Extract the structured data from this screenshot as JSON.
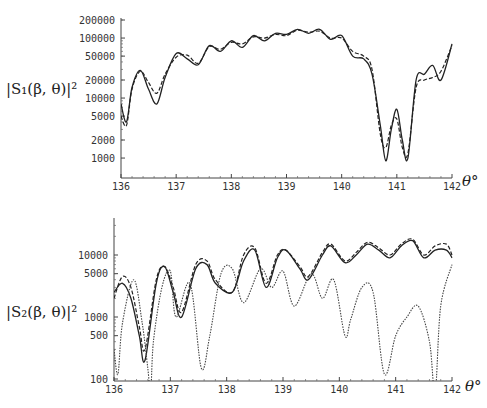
{
  "chart_data": [
    {
      "type": "line",
      "title": "",
      "ylabel": "|S1(β,θ)|²",
      "xlabel": "θ°",
      "yscale": "log",
      "ylim": [
        1000,
        200000
      ],
      "xlim": [
        136,
        142
      ],
      "xticks": [
        "136",
        "137",
        "138",
        "139",
        "140",
        "141",
        "142"
      ],
      "yticks": [
        "200000",
        "100000",
        "50000",
        "20000",
        "10000",
        "5000",
        "2000",
        "1000"
      ],
      "grid": false,
      "legend": null,
      "series": [
        {
          "name": "solid",
          "style": "solid",
          "x": [
            136.0,
            136.1,
            136.2,
            136.35,
            136.5,
            136.65,
            136.8,
            137.0,
            137.2,
            137.4,
            137.6,
            137.8,
            138.0,
            138.2,
            138.4,
            138.6,
            138.8,
            139.0,
            139.2,
            139.4,
            139.6,
            139.8,
            140.0,
            140.2,
            140.4,
            140.55,
            140.7,
            140.8,
            140.9,
            141.0,
            141.1,
            141.2,
            141.35,
            141.5,
            141.65,
            141.8,
            142.0
          ],
          "y": [
            8000,
            4000,
            15000,
            29000,
            14000,
            8000,
            22000,
            55000,
            45000,
            36000,
            75000,
            60000,
            90000,
            70000,
            110000,
            90000,
            120000,
            115000,
            140000,
            120000,
            140000,
            95000,
            110000,
            50000,
            45000,
            25000,
            3500,
            900,
            3000,
            6500,
            2000,
            1000,
            20000,
            25000,
            35000,
            20000,
            80000
          ]
        },
        {
          "name": "dashed",
          "style": "dashed",
          "x": [
            136.0,
            136.1,
            136.2,
            136.35,
            136.5,
            136.65,
            136.8,
            137.0,
            137.2,
            137.4,
            137.6,
            137.8,
            138.0,
            138.2,
            138.4,
            138.6,
            138.8,
            139.0,
            139.2,
            139.4,
            139.6,
            139.8,
            140.0,
            140.2,
            140.4,
            140.55,
            140.7,
            140.8,
            140.9,
            141.0,
            141.1,
            141.2,
            141.35,
            141.5,
            141.65,
            141.8,
            142.0
          ],
          "y": [
            5000,
            3500,
            14000,
            28000,
            18000,
            12000,
            25000,
            48000,
            52000,
            38000,
            72000,
            65000,
            85000,
            80000,
            105000,
            100000,
            115000,
            110000,
            135000,
            125000,
            130000,
            100000,
            100000,
            60000,
            50000,
            30000,
            2500,
            1500,
            3500,
            4500,
            1500,
            1200,
            15000,
            20000,
            22000,
            28000,
            75000
          ]
        }
      ]
    },
    {
      "type": "line",
      "title": "",
      "ylabel": "|S2(β,θ)|²",
      "xlabel": "θ°",
      "yscale": "log",
      "ylim": [
        100,
        40000
      ],
      "xlim": [
        136,
        142
      ],
      "xticks": [
        "136",
        "137",
        "138",
        "139",
        "140",
        "141",
        "142"
      ],
      "yticks": [
        "10000",
        "5000",
        "1000",
        "500",
        "100"
      ],
      "grid": false,
      "legend": null,
      "series": [
        {
          "name": "solid",
          "style": "solid",
          "x": [
            136.0,
            136.15,
            136.3,
            136.45,
            136.55,
            136.75,
            136.9,
            137.05,
            137.2,
            137.45,
            137.65,
            137.8,
            138.1,
            138.3,
            138.5,
            138.7,
            138.9,
            139.05,
            139.3,
            139.45,
            139.7,
            139.85,
            140.1,
            140.3,
            140.5,
            140.7,
            140.9,
            141.1,
            141.3,
            141.5,
            141.7,
            141.9,
            142.0
          ],
          "y": [
            2500,
            3500,
            2000,
            500,
            200,
            3500,
            6500,
            2500,
            1000,
            6000,
            7000,
            3500,
            2500,
            8000,
            12000,
            3000,
            9000,
            12000,
            6000,
            4000,
            10000,
            14000,
            7500,
            10000,
            15000,
            12000,
            9000,
            14000,
            17000,
            9000,
            12000,
            12000,
            9000
          ]
        },
        {
          "name": "dashed",
          "style": "dashed",
          "x": [
            136.0,
            136.15,
            136.3,
            136.45,
            136.55,
            136.75,
            136.9,
            137.05,
            137.2,
            137.45,
            137.65,
            137.8,
            138.1,
            138.3,
            138.5,
            138.7,
            138.9,
            139.05,
            139.3,
            139.45,
            139.7,
            139.85,
            140.1,
            140.3,
            140.5,
            140.7,
            140.9,
            141.1,
            141.3,
            141.5,
            141.7,
            141.9,
            142.0
          ],
          "y": [
            2000,
            4500,
            3000,
            700,
            300,
            4000,
            6500,
            3000,
            1200,
            7000,
            8000,
            4000,
            2500,
            10000,
            13000,
            3500,
            10000,
            12000,
            6500,
            4500,
            11000,
            15000,
            8000,
            11000,
            16000,
            13000,
            10000,
            15000,
            18000,
            10000,
            14000,
            15000,
            10000
          ]
        },
        {
          "name": "dotted",
          "style": "dotted",
          "x": [
            136.0,
            136.07,
            136.15,
            136.35,
            136.5,
            136.6,
            136.65,
            136.7,
            136.85,
            137.0,
            137.1,
            137.35,
            137.55,
            137.7,
            137.9,
            138.1,
            138.3,
            138.6,
            138.8,
            139.0,
            139.2,
            139.5,
            139.7,
            139.9,
            140.1,
            140.2,
            140.4,
            140.6,
            140.8,
            141.0,
            141.2,
            141.4,
            141.6,
            141.7,
            141.8,
            142.0
          ],
          "y": [
            300,
            120,
            800,
            4000,
            800,
            150,
            60,
            400,
            3000,
            5500,
            1000,
            3500,
            150,
            500,
            5000,
            6000,
            1700,
            6000,
            3000,
            5500,
            1500,
            5000,
            2000,
            4000,
            500,
            900,
            3000,
            2500,
            120,
            500,
            1000,
            1500,
            400,
            60,
            1500,
            7000
          ]
        }
      ]
    }
  ],
  "panels": {
    "top": {
      "ylabel_text": "|S₁(β, θ)|²",
      "xlabel_text": "θ°"
    },
    "bottom": {
      "ylabel_text": "|S₂(β, θ)|²",
      "xlabel_text": "θ°"
    }
  }
}
